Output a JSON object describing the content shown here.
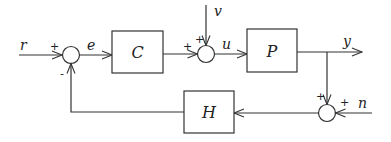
{
  "diagram": {
    "type": "feedback-control-block-diagram",
    "blocks": [
      {
        "id": "C",
        "label": "C",
        "role": "controller"
      },
      {
        "id": "P",
        "label": "P",
        "role": "plant"
      },
      {
        "id": "H",
        "label": "H",
        "role": "sensor/feedback"
      }
    ],
    "junctions": [
      {
        "id": "sum1",
        "inputs": [
          {
            "from": "r",
            "sign": "+"
          },
          {
            "from": "H",
            "sign": "-"
          }
        ],
        "output": "e"
      },
      {
        "id": "sum2",
        "inputs": [
          {
            "from": "C",
            "sign": "+"
          },
          {
            "from": "v",
            "sign": "+"
          }
        ],
        "output": "u"
      },
      {
        "id": "sum3",
        "inputs": [
          {
            "from": "y",
            "sign": "+"
          },
          {
            "from": "n",
            "sign": "+"
          }
        ],
        "output": "H"
      }
    ],
    "signals": {
      "r": "r",
      "e": "e",
      "u": "u",
      "v": "v",
      "y": "y",
      "n": "n"
    },
    "signs": {
      "sum1_r": "+",
      "sum1_fb": "-",
      "sum2_c": "+",
      "sum2_v": "+",
      "sum3_y": "+",
      "sum3_n": "+"
    }
  }
}
